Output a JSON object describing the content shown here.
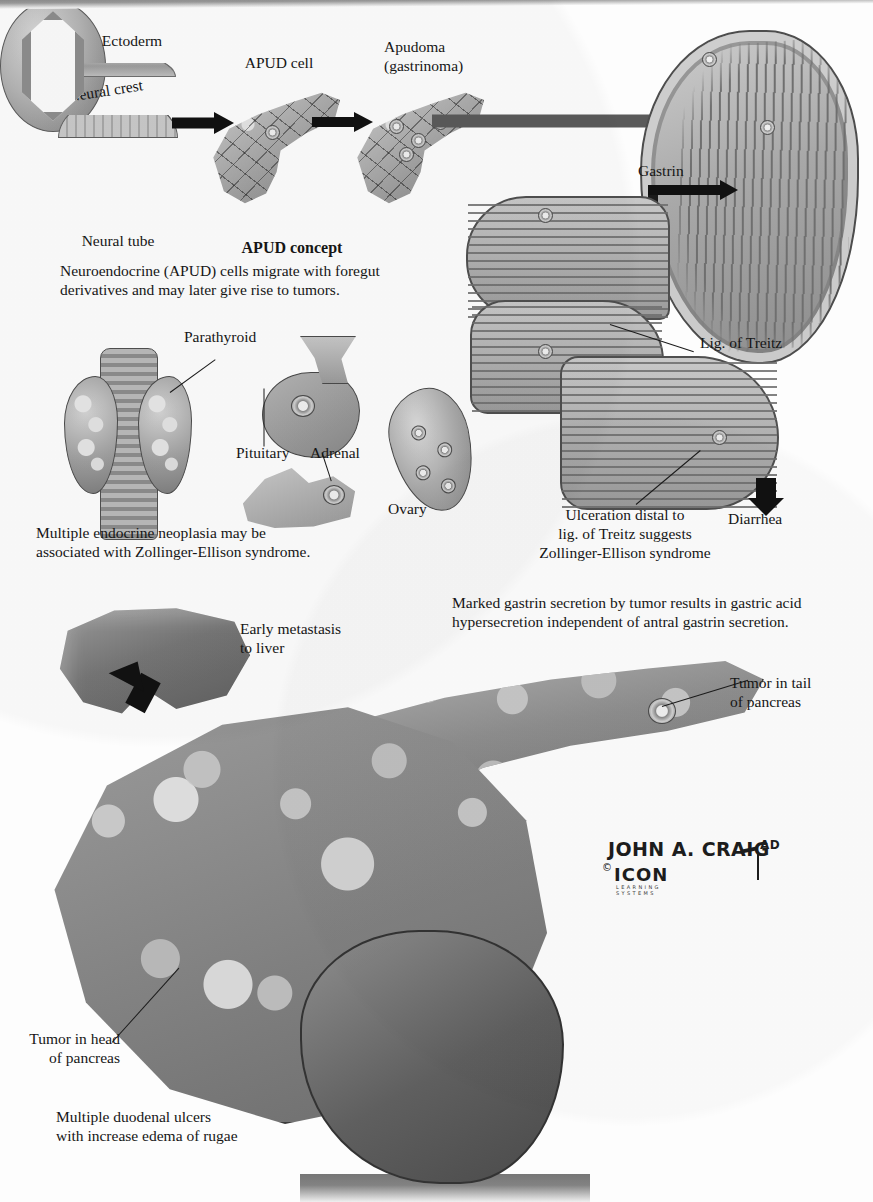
{
  "plate": {
    "title": "Zollinger-Ellison Syndrome",
    "artist_signature": "JOHN A. CRAIG",
    "artist_suffix": "AD",
    "copyright_symbol": "©",
    "publisher": "ICON",
    "publisher_sub_line1": "LEARNING",
    "publisher_sub_line2": "SYSTEMS"
  },
  "apud_panel": {
    "heading": "APUD concept",
    "caption": "Neuroendocrine (APUD) cells migrate with foregut\nderivatives and may later give rise to tumors.",
    "labels": {
      "ectoderm": "Ectoderm",
      "neural_crest": "Neural crest",
      "neural_tube": "Neural tube",
      "apud_cell": "APUD cell",
      "apudoma": "Apudoma\n(gastrinoma)"
    }
  },
  "men_panel": {
    "caption": "Multiple endocrine neoplasia may be\nassociated with Zollinger-Ellison syndrome.",
    "labels": {
      "parathyroid": "Parathyroid",
      "pituitary": "Pituitary",
      "adrenal": "Adrenal",
      "ovary": "Ovary"
    }
  },
  "gi_panel": {
    "labels": {
      "gastrin": "Gastrin",
      "hcl": "HCl",
      "lig_of_treitz": "Lig. of Treitz",
      "ulceration": "Ulceration distal to\nlig. of Treitz suggests\nZollinger-Ellison syndrome",
      "diarrhea": "Diarrhea"
    },
    "caption": "Marked gastrin secretion by tumor results in gastric acid\nhypersecretion independent of antral gastrin secretion."
  },
  "pancreas_panel": {
    "labels": {
      "early_metastasis": "Early metastasis\nto liver",
      "tumor_tail": "Tumor in tail\nof pancreas",
      "tumor_head": "Tumor in head\nof pancreas"
    },
    "caption": "Multiple duodenal ulcers\nwith increase edema of rugae"
  },
  "colors": {
    "ink": "#161616",
    "arrow_gray": "#5a5a5a",
    "arrow_black": "#111111",
    "paper": "#fdfdfd",
    "tissue_light": "#d0d0d0",
    "tissue_mid": "#9a9a9a",
    "tissue_dark": "#6d6d6d"
  }
}
